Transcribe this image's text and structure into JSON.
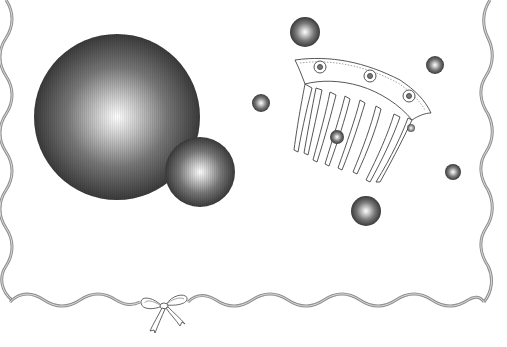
{
  "scene": {
    "title": "Decorative stationery frame with spheres, hair comb and ribbon bow",
    "background": "#ffffff",
    "frame": {
      "style": "wavy-ribbon",
      "color": "#9a9a9a",
      "highlight": "#d8d8d8",
      "left_x": 6,
      "right_x": 486,
      "bottom_y": 301,
      "top_y": 0
    },
    "spheres": [
      {
        "id": "large-sphere",
        "cx": 117,
        "cy": 117,
        "r": 83
      },
      {
        "id": "medium-sphere",
        "cx": 200,
        "cy": 172,
        "r": 35
      },
      {
        "id": "top-sphere",
        "cx": 305,
        "cy": 32,
        "r": 15
      },
      {
        "id": "left-small-sphere",
        "cx": 261,
        "cy": 103,
        "r": 9
      },
      {
        "id": "right-small-sphere",
        "cx": 435,
        "cy": 65,
        "r": 9
      },
      {
        "id": "comb-sphere",
        "cx": 337,
        "cy": 137,
        "r": 7
      },
      {
        "id": "tiny-sphere",
        "cx": 411,
        "cy": 128,
        "r": 4
      },
      {
        "id": "lower-right-sphere",
        "cx": 453,
        "cy": 172,
        "r": 8
      },
      {
        "id": "bottom-sphere",
        "cx": 366,
        "cy": 211,
        "r": 15
      }
    ],
    "comb": {
      "label": "ornamental hair comb",
      "teeth": 7
    },
    "bow": {
      "label": "ribbon bow",
      "cx": 163,
      "cy": 312
    }
  }
}
